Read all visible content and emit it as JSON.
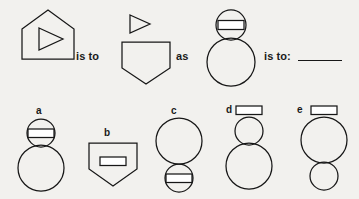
{
  "puzzle": {
    "type": "visual-analogy",
    "connector_1": "is to",
    "connector_2": "as",
    "connector_3": "is to:",
    "answer_blank": "",
    "stem": {
      "term_a": {
        "name": "house-pentagon-with-inner-triangle",
        "outer_shape": "pentagon-peaked-roof-flat-bottom",
        "inner_shape": "triangle-pointing-right",
        "inner_position": "inside"
      },
      "term_b": {
        "name": "inverted-pentagon-with-outer-triangle",
        "outer_shape": "pentagon-flat-top-point-bottom",
        "inner_shape": "triangle-pointing-right",
        "inner_position": "outside-above"
      },
      "term_c": {
        "name": "small-circle-with-bar-over-large-circle",
        "top_shape": "small-circle",
        "top_contains": "horizontal-bar",
        "bottom_shape": "large-circle",
        "bar_position": "inside"
      }
    },
    "rule": "the inner element moves outside and above the figure",
    "options": [
      {
        "letter": "a",
        "name": "option-a",
        "description": "small circle with bar inside, above large circle",
        "bar_position": "inside",
        "order": "small-top-large-bottom"
      },
      {
        "letter": "b",
        "name": "option-b",
        "description": "inverted pentagon with bar inside",
        "bar_position": "inside",
        "order": "pentagon"
      },
      {
        "letter": "c",
        "name": "option-c",
        "description": "large circle above small circle with bar inside",
        "bar_position": "inside",
        "order": "large-top-small-bottom"
      },
      {
        "letter": "d",
        "name": "option-d",
        "description": "bar outside above small circle, large circle below",
        "bar_position": "outside-above",
        "order": "small-top-large-bottom"
      },
      {
        "letter": "e",
        "name": "option-e",
        "description": "bar outside above large circle, small circle below",
        "bar_position": "outside-above",
        "order": "large-top-small-bottom"
      }
    ]
  },
  "colors": {
    "background": "#f2f1ee",
    "ink": "#171717",
    "fill": "#ffffff"
  }
}
